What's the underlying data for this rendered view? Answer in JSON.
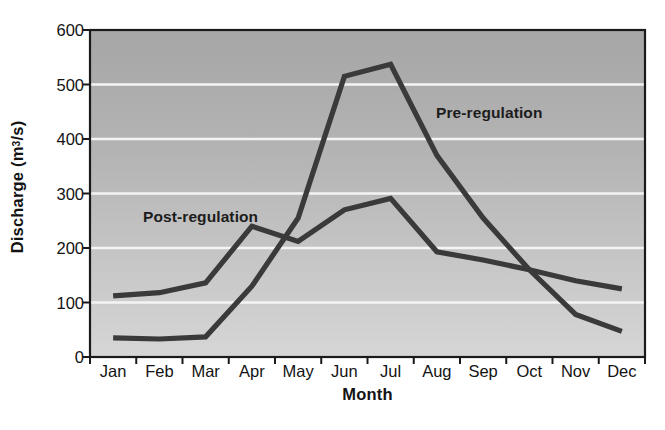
{
  "chart_data": {
    "type": "line",
    "title": "",
    "xlabel": "Month",
    "ylabel": "Discharge  (m3/s)",
    "ylabel_base": "Discharge  (m",
    "ylabel_sup": "3",
    "ylabel_tail": "/s)",
    "categories": [
      "Jan",
      "Feb",
      "Mar",
      "Apr",
      "May",
      "Jun",
      "Jul",
      "Aug",
      "Sep",
      "Oct",
      "Nov",
      "Dec"
    ],
    "ylim": [
      0,
      600
    ],
    "yticks": [
      0,
      100,
      200,
      300,
      400,
      500,
      600
    ],
    "ytick_labels": [
      "0",
      "100",
      "200",
      "300",
      "400",
      "500",
      "600"
    ],
    "grid": "horizontal-white-gridlines",
    "legend_position": "inline-annotations",
    "series": [
      {
        "name": "Post-regulation",
        "label_position": "upper-left-inside",
        "values": [
          112,
          118,
          136,
          240,
          212,
          270,
          291,
          193,
          178,
          160,
          140,
          125
        ]
      },
      {
        "name": "Pre-regulation",
        "label_position": "upper-right-inside",
        "values": [
          35,
          33,
          37,
          130,
          255,
          515,
          537,
          370,
          255,
          160,
          78,
          47
        ]
      }
    ],
    "colors": {
      "line": "#3a3a3a",
      "plot_bg_top": "#a9a9a9",
      "plot_bg_bottom": "#d2d2d2",
      "gridline": "#f4f4f4",
      "frame": "#1a1a1a",
      "text": "#131313"
    }
  }
}
